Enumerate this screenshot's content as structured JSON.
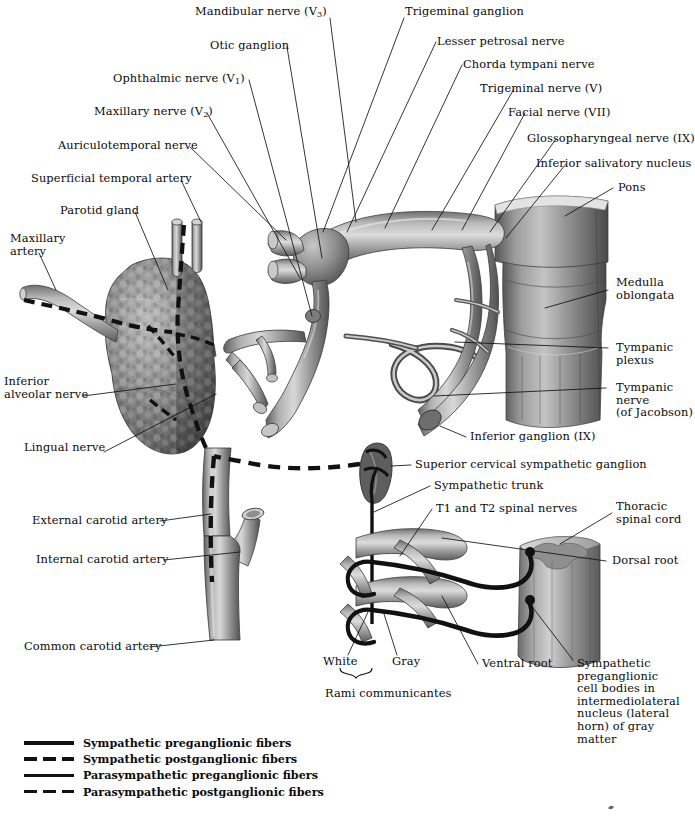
{
  "figure": {
    "line_color": "#111111",
    "tissue_gray": "#8d8d8d",
    "tissue_dark": "#4a4a4a",
    "tissue_light": "#c9c9c9"
  },
  "labels": [
    {
      "id": "mandibular-nerve",
      "text": "Mandibular nerve (V",
      "sub": "3",
      "tail": ")"
    },
    {
      "id": "otic-ganglion",
      "text": "Otic ganglion"
    },
    {
      "id": "ophthalmic-nerve",
      "text": "Ophthalmic nerve (V",
      "sub": "1",
      "tail": ")"
    },
    {
      "id": "maxillary-nerve",
      "text": "Maxillary nerve (V",
      "sub": "2",
      "tail": ")"
    },
    {
      "id": "auriculotemporal-nerve",
      "text": "Auriculotemporal nerve"
    },
    {
      "id": "superficial-temporal-artery",
      "text": "Superficial temporal artery"
    },
    {
      "id": "parotid-gland",
      "text": "Parotid gland"
    },
    {
      "id": "maxillary-artery",
      "text": "Maxillary\nartery"
    },
    {
      "id": "inferior-alveolar-nerve",
      "text": "Inferior\nalveolar nerve"
    },
    {
      "id": "lingual-nerve",
      "text": "Lingual nerve"
    },
    {
      "id": "external-carotid-artery",
      "text": "External carotid artery"
    },
    {
      "id": "internal-carotid-artery",
      "text": "Internal carotid artery"
    },
    {
      "id": "common-carotid-artery",
      "text": "Common carotid artery"
    },
    {
      "id": "trigeminal-ganglion",
      "text": "Trigeminal ganglion"
    },
    {
      "id": "lesser-petrosal-nerve",
      "text": "Lesser petrosal nerve"
    },
    {
      "id": "chorda-tympani-nerve",
      "text": "Chorda tympani nerve"
    },
    {
      "id": "trigeminal-nerve",
      "text": "Trigeminal nerve (V)"
    },
    {
      "id": "facial-nerve",
      "text": "Facial nerve (VII)"
    },
    {
      "id": "glossopharyngeal-nerve",
      "text": "Glossopharyngeal nerve (IX)"
    },
    {
      "id": "inferior-salivatory-nucleus",
      "text": "Inferior salivatory nucleus"
    },
    {
      "id": "pons",
      "text": "Pons"
    },
    {
      "id": "medulla-oblongata",
      "text": "Medulla\noblongata"
    },
    {
      "id": "tympanic-plexus",
      "text": "Tympanic\nplexus"
    },
    {
      "id": "tympanic-nerve",
      "text": "Tympanic\nnerve\n(of Jacobson)"
    },
    {
      "id": "inferior-ganglion",
      "text": "Inferior ganglion (IX)"
    },
    {
      "id": "superior-cervical-sympathetic-ganglion",
      "text": "Superior cervical sympathetic ganglion"
    },
    {
      "id": "sympathetic-trunk",
      "text": "Sympathetic trunk"
    },
    {
      "id": "t1-t2-spinal-nerves",
      "text": "T1 and T2 spinal nerves"
    },
    {
      "id": "thoracic-spinal-cord",
      "text": "Thoracic\nspinal cord"
    },
    {
      "id": "dorsal-root",
      "text": "Dorsal root"
    },
    {
      "id": "ventral-root",
      "text": "Ventral root"
    },
    {
      "id": "white-ramus",
      "text": "White"
    },
    {
      "id": "gray-ramus",
      "text": "Gray"
    },
    {
      "id": "rami-communicantes",
      "text": "Rami communicantes"
    },
    {
      "id": "sympathetic-preganglionic-cell-bodies",
      "text": "Sympathetic\npreganglionic\ncell bodies in\nintermediolateral\nnucleus (lateral\nhorn) of gray\nmatter"
    }
  ],
  "label_text": {
    "mandibular_nerve_pre": "Mandibular nerve (V",
    "mandibular_nerve_sub": "3",
    "mandibular_nerve_post": ")",
    "otic_ganglion": "Otic ganglion",
    "ophthalmic_nerve_pre": "Ophthalmic nerve (V",
    "ophthalmic_nerve_sub": "1",
    "ophthalmic_nerve_post": ")",
    "maxillary_nerve_pre": "Maxillary nerve (V",
    "maxillary_nerve_sub": "2",
    "maxillary_nerve_post": ")",
    "auriculotemporal_nerve": "Auriculotemporal nerve",
    "superficial_temporal_artery": "Superficial temporal artery",
    "parotid_gland": "Parotid gland",
    "maxillary_artery_l1": "Maxillary",
    "maxillary_artery_l2": "artery",
    "inferior_alveolar_nerve_l1": "Inferior",
    "inferior_alveolar_nerve_l2": "alveolar nerve",
    "lingual_nerve": "Lingual nerve",
    "external_carotid_artery": "External carotid artery",
    "internal_carotid_artery": "Internal carotid artery",
    "common_carotid_artery": "Common carotid artery",
    "trigeminal_ganglion": "Trigeminal ganglion",
    "lesser_petrosal_nerve": "Lesser petrosal nerve",
    "chorda_tympani_nerve": "Chorda tympani nerve",
    "trigeminal_nerve": "Trigeminal nerve (V)",
    "facial_nerve": "Facial nerve (VII)",
    "glossopharyngeal_nerve": "Glossopharyngeal nerve (IX)",
    "inferior_salivatory_nucleus": "Inferior salivatory nucleus",
    "pons": "Pons",
    "medulla_oblongata_l1": "Medulla",
    "medulla_oblongata_l2": "oblongata",
    "tympanic_plexus_l1": "Tympanic",
    "tympanic_plexus_l2": "plexus",
    "tympanic_nerve_l1": "Tympanic",
    "tympanic_nerve_l2": "nerve",
    "tympanic_nerve_l3": "(of Jacobson)",
    "inferior_ganglion": "Inferior ganglion (IX)",
    "superior_cervical_sympathetic_ganglion": "Superior cervical sympathetic ganglion",
    "sympathetic_trunk": "Sympathetic trunk",
    "t1_t2_spinal_nerves": "T1 and T2 spinal nerves",
    "thoracic_spinal_cord_l1": "Thoracic",
    "thoracic_spinal_cord_l2": "spinal cord",
    "dorsal_root": "Dorsal root",
    "ventral_root": "Ventral root",
    "white_ramus": "White",
    "gray_ramus": "Gray",
    "rami_communicantes": "Rami communicantes",
    "symp_cell_l1": "Sympathetic",
    "symp_cell_l2": "preganglionic",
    "symp_cell_l3": "cell bodies in",
    "symp_cell_l4": "intermediolateral",
    "symp_cell_l5": "nucleus (lateral",
    "symp_cell_l6": "horn) of gray",
    "symp_cell_l7": "matter"
  },
  "legend": {
    "items": [
      {
        "label": "Sympathetic preganglionic fibers",
        "style": "solid-thick"
      },
      {
        "label": "Sympathetic postganglionic fibers",
        "style": "dash-thick"
      },
      {
        "label": "Parasympathetic preganglionic fibers",
        "style": "solid-thin"
      },
      {
        "label": "Parasympathetic postganglionic fibers",
        "style": "dash-thin"
      }
    ]
  }
}
